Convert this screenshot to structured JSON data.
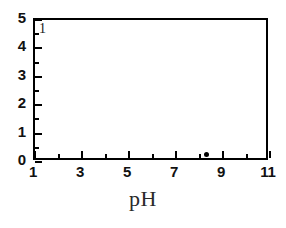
{
  "chart_data": {
    "type": "scatter",
    "title": "",
    "subtitle": "",
    "xlabel": "pH",
    "ylabel": "",
    "xlim": [
      1,
      11
    ],
    "ylim": [
      0,
      5
    ],
    "grid": false,
    "legend": null,
    "xticks": [
      1,
      3,
      5,
      7,
      9,
      11
    ],
    "xtick_labels": [
      "1",
      "3",
      "5",
      "7",
      "9",
      "11"
    ],
    "x_minor_ticks": [
      2,
      4,
      6,
      8,
      10
    ],
    "yticks": [
      0,
      1,
      2,
      3,
      4,
      5
    ],
    "ytick_labels": [
      "0",
      "1",
      "2",
      "3",
      "4",
      "5"
    ],
    "y_minor_ticks": [
      0.5,
      1.5,
      2.5,
      3.5,
      4.5
    ],
    "annotations": [
      {
        "text": "1",
        "x": 1.25,
        "y": 4.6
      }
    ],
    "series": [
      {
        "name": "",
        "marker": "filled-circle",
        "color": "#000000",
        "points": [
          {
            "x": 8.4,
            "y": 0.18
          }
        ]
      }
    ]
  },
  "figure": {
    "background_color": "#ffffff",
    "axis_color": "#000000",
    "text_color": "#111111"
  }
}
